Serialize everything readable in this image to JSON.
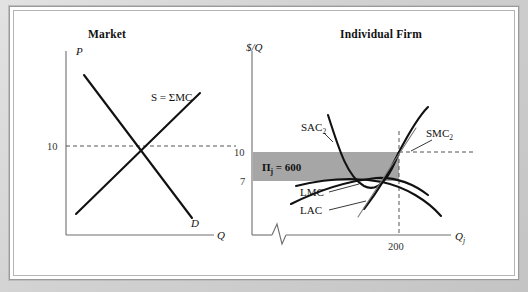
{
  "figure": {
    "panels": [
      {
        "id": "market",
        "title": "Market",
        "y_axis_label": "P",
        "x_axis_label": "Q",
        "y_ticks": [
          "10"
        ],
        "curves": [
          {
            "name": "supply",
            "label": "S = ΣMC"
          },
          {
            "name": "demand",
            "label": "D"
          }
        ]
      },
      {
        "id": "individual-firm",
        "title": "Individual Firm",
        "y_axis_label": "$/Q",
        "x_axis_label_base": "Q",
        "x_axis_label_sub": "j",
        "y_ticks": [
          "10",
          "7"
        ],
        "x_ticks": [
          "200"
        ],
        "profit_label_base": "Π",
        "profit_label_sub": "j",
        "profit_label_rest": " = 600",
        "curves": [
          {
            "name": "sac2",
            "label_base": "SAC",
            "label_sub": "2"
          },
          {
            "name": "smc2",
            "label_base": "SMC",
            "label_sub": "2"
          },
          {
            "name": "lmc",
            "label_base": "LMC",
            "label_sub": ""
          },
          {
            "name": "lac",
            "label_base": "LAC",
            "label_sub": ""
          }
        ]
      }
    ],
    "colors": {
      "profit_fill": "#a6a6a6",
      "curve": "#111111",
      "axis": "#6e6e6e",
      "frame": "#b4b4b4",
      "page_background": "#c9c9c9"
    }
  }
}
